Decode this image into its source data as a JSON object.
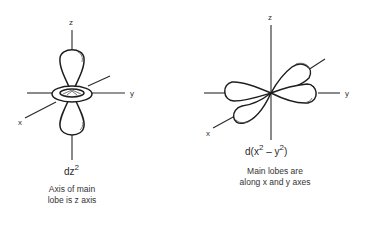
{
  "figures": [
    {
      "id": "dz2",
      "orbital": {
        "prefix": "dz",
        "sup": "2"
      },
      "axes": {
        "x": "x",
        "y": "y",
        "z": "z"
      },
      "caption": [
        "Axis of main",
        "lobe is z axis"
      ]
    },
    {
      "id": "dx2-y2",
      "orbital": {
        "prefix": "d(x",
        "sup1": "2",
        "mid": " – y",
        "sup2": "2",
        "suffix": ")"
      },
      "axes": {
        "x": "x",
        "y": "y",
        "z": "z"
      },
      "caption": [
        "Main lobes are",
        "along x and y axes"
      ]
    }
  ]
}
